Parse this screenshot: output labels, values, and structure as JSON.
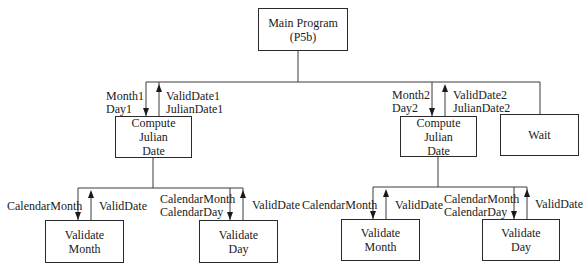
{
  "diagram": {
    "type": "structure-chart",
    "nodes": {
      "main": {
        "line1": "Main Program",
        "line2": "(P5b)"
      },
      "compute1": {
        "line1": "Compute",
        "line2": "Julian",
        "line3": "Date"
      },
      "compute2": {
        "line1": "Compute",
        "line2": "Julian",
        "line3": "Date"
      },
      "wait": {
        "line1": "Wait"
      },
      "validate_month1": {
        "line1": "Validate",
        "line2": "Month"
      },
      "validate_day1": {
        "line1": "Validate",
        "line2": "Day"
      },
      "validate_month2": {
        "line1": "Validate",
        "line2": "Month"
      },
      "validate_day2": {
        "line1": "Validate",
        "line2": "Day"
      }
    },
    "flows": {
      "compute1_in": [
        "Month1",
        "Day1"
      ],
      "compute1_out": [
        "ValidDate1",
        "JulianDate1"
      ],
      "compute2_in": [
        "Month2",
        "Day2"
      ],
      "compute2_out": [
        "ValidDate2",
        "JulianDate2"
      ],
      "vm1_in": [
        "CalendarMonth"
      ],
      "vm1_out": [
        "ValidDate"
      ],
      "vd1_in": [
        "CalendarMonth",
        "CalendarDay"
      ],
      "vd1_out": [
        "ValidDate"
      ],
      "vm2_in": [
        "CalendarMonth"
      ],
      "vm2_out": [
        "ValidDate"
      ],
      "vd2_in": [
        "CalendarMonth",
        "CalendarDay"
      ],
      "vd2_out": [
        "ValidDate"
      ]
    },
    "edges": [
      [
        "Main Program (P5b)",
        "Compute Julian Date (1)"
      ],
      [
        "Main Program (P5b)",
        "Compute Julian Date (2)"
      ],
      [
        "Main Program (P5b)",
        "Wait"
      ],
      [
        "Compute Julian Date (1)",
        "Validate Month (1)"
      ],
      [
        "Compute Julian Date (1)",
        "Validate Day (1)"
      ],
      [
        "Compute Julian Date (2)",
        "Validate Month (2)"
      ],
      [
        "Compute Julian Date (2)",
        "Validate Day (2)"
      ]
    ]
  }
}
